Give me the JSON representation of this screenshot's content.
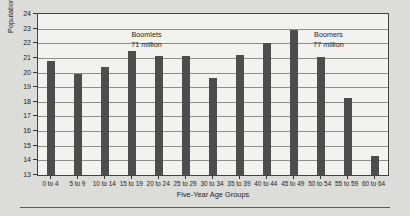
{
  "chart_data": {
    "type": "bar",
    "title": "",
    "xlabel": "Five-Year Age Groups",
    "ylabel": "Population in Millions",
    "ylim": [
      13,
      24
    ],
    "yticks": [
      13,
      14,
      15,
      16,
      17,
      18,
      19,
      20,
      21,
      22,
      23,
      24
    ],
    "grid": true,
    "legend": "none",
    "categories": [
      "0 to 4",
      "5 to 9",
      "10 to 14",
      "15 to 19",
      "20 to 24",
      "25 to 29",
      "30 to 34",
      "35 to 39",
      "40 to 44",
      "45 to 49",
      "50 to 54",
      "55 to 59",
      "60 to 64"
    ],
    "values": [
      20.8,
      19.9,
      20.4,
      21.5,
      21.1,
      21.1,
      19.6,
      21.2,
      22.05,
      22.9,
      21.05,
      18.25,
      14.3
    ],
    "bar_color": "#4d4d4d",
    "plot_bg": "#f2f2ee",
    "annotations": [
      {
        "name": "boomlets",
        "line1": "Boomlets",
        "line2": "71 million",
        "x_center_pct": 31.0,
        "y_top_px": 16
      },
      {
        "name": "boomers",
        "line1": "Boomers",
        "line2": "77 million",
        "x_center_pct": 83.0,
        "y_top_px": 16
      }
    ]
  }
}
